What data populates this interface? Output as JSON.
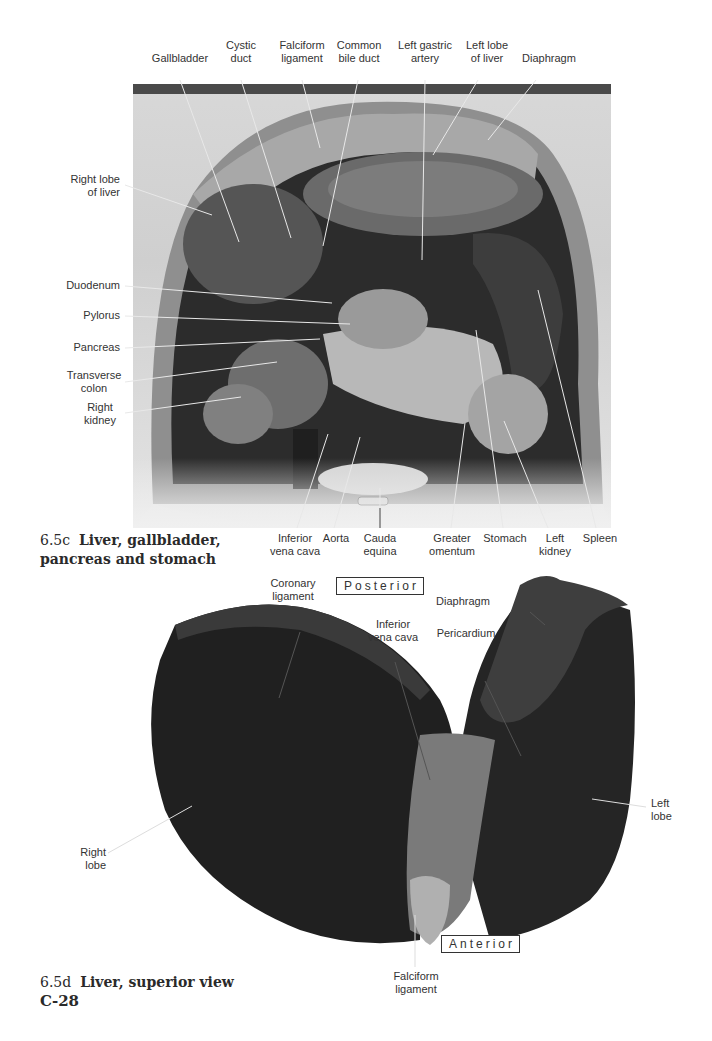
{
  "figure_c": {
    "caption_number": "6.5c",
    "caption_text_line1": "Liver, gallbladder,",
    "caption_text_line2": "pancreas and stomach",
    "top_labels": [
      {
        "l1": "Gallbladder",
        "l2": ""
      },
      {
        "l1": "Cystic",
        "l2": "duct"
      },
      {
        "l1": "Falciform",
        "l2": "ligament"
      },
      {
        "l1": "Common",
        "l2": "bile duct"
      },
      {
        "l1": "Left gastric",
        "l2": "artery"
      },
      {
        "l1": "Left lobe",
        "l2": "of liver"
      },
      {
        "l1": "Diaphragm",
        "l2": ""
      }
    ],
    "left_labels": [
      {
        "l1": "Right lobe",
        "l2": "of liver"
      },
      {
        "l1": "Duodenum",
        "l2": ""
      },
      {
        "l1": "Pylorus",
        "l2": ""
      },
      {
        "l1": "Pancreas",
        "l2": ""
      },
      {
        "l1": "Transverse",
        "l2": "colon"
      },
      {
        "l1": "Right",
        "l2": "kidney"
      }
    ],
    "bottom_labels": [
      {
        "l1": "Inferior",
        "l2": "vena cava"
      },
      {
        "l1": "Aorta",
        "l2": ""
      },
      {
        "l1": "Cauda",
        "l2": "equina"
      },
      {
        "l1": "Greater",
        "l2": "omentum"
      },
      {
        "l1": "Stomach",
        "l2": ""
      },
      {
        "l1": "Left",
        "l2": "kidney"
      },
      {
        "l1": "Spleen",
        "l2": ""
      }
    ]
  },
  "figure_d": {
    "caption_number": "6.5d",
    "caption_text": "Liver, superior view",
    "orientation_top": "Posterior",
    "orientation_bottom": "Anterior",
    "labels": {
      "coronary_ligament": {
        "l1": "Coronary",
        "l2": "ligament"
      },
      "inferior_vena_cava": {
        "l1": "Inferior",
        "l2": "vena cava"
      },
      "diaphragm": {
        "l1": "Diaphragm",
        "l2": ""
      },
      "pericardium": {
        "l1": "Pericardium",
        "l2": ""
      },
      "left_lobe": {
        "l1": "Left",
        "l2": "lobe"
      },
      "right_lobe": {
        "l1": "Right",
        "l2": "lobe"
      },
      "falciform_ligament": {
        "l1": "Falciform",
        "l2": "ligament"
      }
    }
  },
  "page_number": "C-28"
}
